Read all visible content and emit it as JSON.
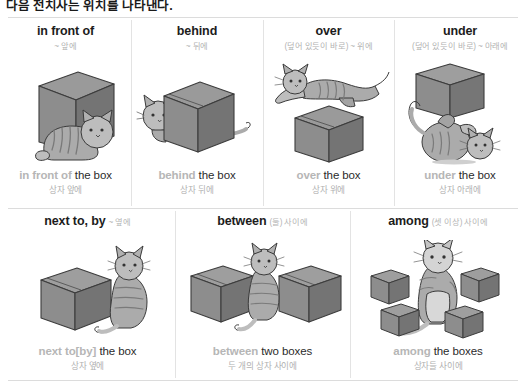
{
  "heading": {
    "text": "다음 전치사는 위치를 나타낸다."
  },
  "colors": {
    "keyword": "#b6b6b6",
    "gloss": "#b2b2b2",
    "text": "#1c1c1c",
    "rule": "#dcdcdc",
    "box_fill": "#8a8a8a",
    "box_top": "#9e9e9e",
    "box_side": "#6f6f6f",
    "cat_fill": "#a8a8a8"
  },
  "row1": {
    "cells": [
      {
        "term": "in front of",
        "gloss": "~ 앞에",
        "caption_keyword": "in front of",
        "caption_rest": " the box",
        "caption_ko": "상자 앞에",
        "art": "cat-in-front-of-box"
      },
      {
        "term": "behind",
        "gloss": "~ 뒤에",
        "caption_keyword": "behind",
        "caption_rest": " the box",
        "caption_ko": "상자 뒤에",
        "art": "cat-behind-box"
      },
      {
        "term": "over",
        "gloss": "(덮어 있듯이 바로) ~ 위에",
        "caption_keyword": "over",
        "caption_rest": " the box",
        "caption_ko": "상자 위에",
        "art": "cat-over-box"
      },
      {
        "term": "under",
        "gloss": "(덮어 있듯이 바로) ~ 아래에",
        "caption_keyword": "under",
        "caption_rest": " the box",
        "caption_ko": "상자 아래에",
        "art": "cat-under-box"
      }
    ]
  },
  "row2": {
    "cells": [
      {
        "term": "next to, by",
        "gloss": "~ 옆에",
        "caption_keyword": "next to[by]",
        "caption_rest": " the box",
        "caption_ko": "상자 옆에",
        "art": "cat-next-to-box"
      },
      {
        "term": "between",
        "gloss": "(둘) 사이에",
        "caption_keyword": "between",
        "caption_rest": " two boxes",
        "caption_ko": "두 개의 상자 사이에",
        "art": "cat-between-boxes"
      },
      {
        "term": "among",
        "gloss": "(셋 이상) 사이에",
        "caption_keyword": "among",
        "caption_rest": " the boxes",
        "caption_ko": "상자들 사이에",
        "art": "cat-among-boxes"
      }
    ]
  }
}
